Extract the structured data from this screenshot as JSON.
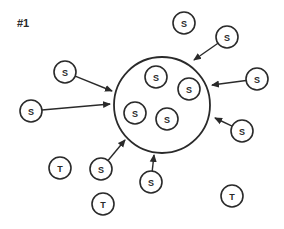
{
  "title": "#1",
  "colors": {
    "stroke": "#2a2a2a",
    "background": "#ffffff"
  },
  "big_circle": {
    "cx": 162,
    "cy": 105,
    "r": 48
  },
  "inner_nodes": [
    {
      "label": "S",
      "cx": 156,
      "cy": 77
    },
    {
      "label": "S",
      "cx": 189,
      "cy": 89
    },
    {
      "label": "S",
      "cx": 135,
      "cy": 113
    },
    {
      "label": "S",
      "cx": 167,
      "cy": 119
    }
  ],
  "outer_nodes": [
    {
      "label": "S",
      "cx": 65,
      "cy": 72,
      "arrow_to": [
        112,
        91
      ]
    },
    {
      "label": "S",
      "cx": 31,
      "cy": 111,
      "arrow_to": [
        110,
        104
      ]
    },
    {
      "label": "S",
      "cx": 184,
      "cy": 23,
      "arrow_to": null
    },
    {
      "label": "S",
      "cx": 227,
      "cy": 37,
      "arrow_to": [
        194,
        60
      ]
    },
    {
      "label": "S",
      "cx": 257,
      "cy": 79,
      "arrow_to": [
        212,
        85
      ]
    },
    {
      "label": "S",
      "cx": 242,
      "cy": 131,
      "arrow_to": [
        215,
        118
      ]
    },
    {
      "label": "T",
      "cx": 60,
      "cy": 168,
      "arrow_to": null
    },
    {
      "label": "S",
      "cx": 101,
      "cy": 169,
      "arrow_to": [
        125,
        140
      ]
    },
    {
      "label": "S",
      "cx": 151,
      "cy": 182,
      "arrow_to": [
        154,
        155
      ]
    },
    {
      "label": "T",
      "cx": 103,
      "cy": 204,
      "arrow_to": null
    },
    {
      "label": "T",
      "cx": 232,
      "cy": 196,
      "arrow_to": null
    }
  ],
  "node_radius": 11
}
